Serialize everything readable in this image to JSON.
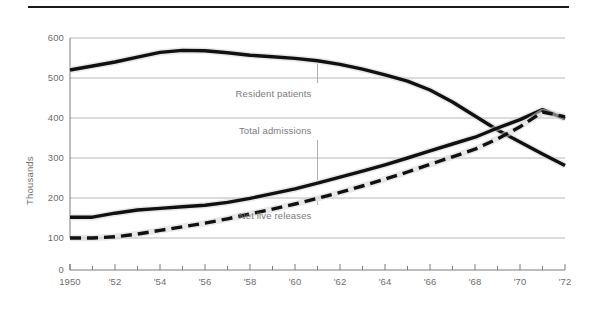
{
  "figure": {
    "background": "#ffffff",
    "top_rule_color": "#1a1a1a",
    "grid_color": "#9a9a9a",
    "axis_color": "#6e6e6e",
    "text_color": "#6e6e6e",
    "annotation_color": "#7a7a7a",
    "line_color": "#111111"
  },
  "chart_data": {
    "type": "line",
    "title": "",
    "subtitle": "",
    "xlabel": "",
    "ylabel": "Thousands",
    "xlim": [
      1950,
      1972
    ],
    "ylim": [
      0,
      600
    ],
    "grid": "horizontal",
    "legend": "inline-annotations",
    "y_ticks": [
      0,
      100,
      200,
      300,
      400,
      500,
      600
    ],
    "y_tick_labels": [
      "0",
      "100",
      "200",
      "300",
      "400",
      "500",
      "600"
    ],
    "y_axis_break": true,
    "x_ticks": [
      1950,
      1951,
      1952,
      1953,
      1954,
      1955,
      1956,
      1957,
      1958,
      1959,
      1960,
      1961,
      1962,
      1963,
      1964,
      1965,
      1966,
      1967,
      1968,
      1969,
      1970,
      1971,
      1972
    ],
    "x_tick_labels": [
      "1950",
      "",
      "'52",
      "",
      "'54",
      "",
      "'56",
      "",
      "'58",
      "",
      "'60",
      "",
      "'62",
      "",
      "'64",
      "",
      "'66",
      "",
      "'68",
      "",
      "'70",
      "",
      "'72"
    ],
    "x": [
      1950,
      1951,
      1952,
      1953,
      1954,
      1955,
      1956,
      1957,
      1958,
      1959,
      1960,
      1961,
      1962,
      1963,
      1964,
      1965,
      1966,
      1967,
      1968,
      1969,
      1970,
      1971,
      1972
    ],
    "series": [
      {
        "name": "Resident patients",
        "style": "solid",
        "values": [
          520,
          530,
          540,
          552,
          564,
          569,
          568,
          563,
          557,
          553,
          549,
          543,
          534,
          522,
          508,
          492,
          470,
          440,
          405,
          370,
          340,
          310,
          281
        ]
      },
      {
        "name": "Total admissions",
        "style": "solid",
        "values": [
          152,
          152,
          162,
          170,
          174,
          178,
          182,
          189,
          199,
          211,
          223,
          237,
          252,
          267,
          283,
          300,
          318,
          335,
          352,
          375,
          396,
          421,
          398
        ]
      },
      {
        "name": "Net live releases",
        "style": "dashed",
        "values": [
          100,
          100,
          103,
          110,
          119,
          128,
          137,
          148,
          160,
          172,
          185,
          199,
          214,
          230,
          247,
          265,
          284,
          303,
          322,
          348,
          378,
          415,
          403
        ]
      }
    ],
    "annotations": [
      {
        "label": "Resident patients",
        "series": "Resident patients",
        "leader": "up",
        "x_year": 1961
      },
      {
        "label": "Total admissions",
        "series": "Total admissions",
        "leader": "down",
        "x_year": 1961
      },
      {
        "label": "Net live releases",
        "series": "Net live releases",
        "leader": "up",
        "x_year": 1961
      }
    ]
  }
}
